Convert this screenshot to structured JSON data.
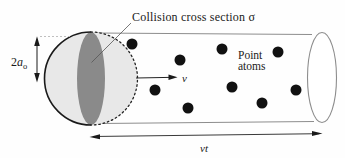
{
  "figure": {
    "title_label": "Collision cross section σ",
    "dimension_label": {
      "prefix": "2",
      "symbol": "a",
      "subscript": "o"
    },
    "velocity_label": "v",
    "sweep_label": "vt",
    "atoms_label": {
      "line1": "Point",
      "line2": "atoms"
    }
  },
  "atoms": {
    "count": 9,
    "radius": 5.5,
    "positions": [
      [
        132,
        44
      ],
      [
        180,
        60
      ],
      [
        222,
        49
      ],
      [
        278,
        52
      ],
      [
        155,
        90
      ],
      [
        188,
        108
      ],
      [
        232,
        87
      ],
      [
        262,
        103
      ],
      [
        296,
        90
      ]
    ]
  },
  "colors": {
    "background": "#fefefe",
    "sphere_fill": "#e8e8e8",
    "cross_section_fill": "#8a8a8a",
    "outline_gray": "#8d8d8d",
    "ink": "#1a1a1a",
    "dot": "#111111"
  }
}
